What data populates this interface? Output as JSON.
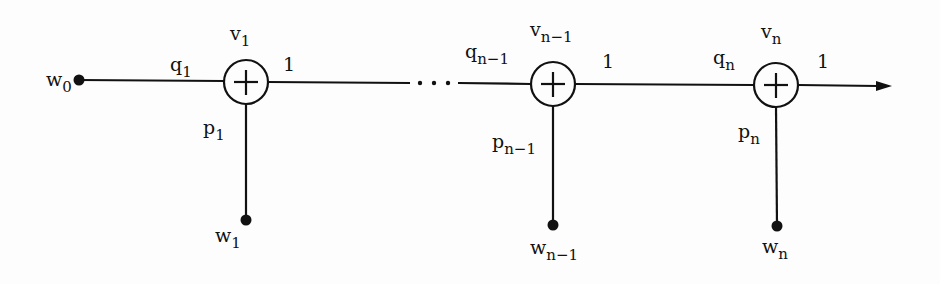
{
  "diagram": {
    "type": "signal-flow-graph",
    "source": {
      "label": "w",
      "sub": "0"
    },
    "nodes": [
      {
        "id": "v1",
        "label": "v",
        "sub": "1",
        "input_weight": {
          "label": "q",
          "sub": "1"
        },
        "branch_weight": {
          "label": "p",
          "sub": "1"
        },
        "output_weight": "1",
        "branch_input": {
          "label": "w",
          "sub": "1"
        },
        "operator": "+"
      },
      {
        "id": "vn-1",
        "label": "v",
        "sub": "n−1",
        "input_weight": {
          "label": "q",
          "sub": "n−1"
        },
        "branch_weight": {
          "label": "p",
          "sub": "n−1"
        },
        "output_weight": "1",
        "branch_input": {
          "label": "w",
          "sub": "n−1"
        },
        "operator": "+"
      },
      {
        "id": "vn",
        "label": "v",
        "sub": "n",
        "input_weight": {
          "label": "q",
          "sub": "n"
        },
        "branch_weight": {
          "label": "p",
          "sub": "n"
        },
        "output_weight": "1",
        "branch_input": {
          "label": "w",
          "sub": "n"
        },
        "operator": "+"
      }
    ],
    "ellipsis": "···"
  }
}
